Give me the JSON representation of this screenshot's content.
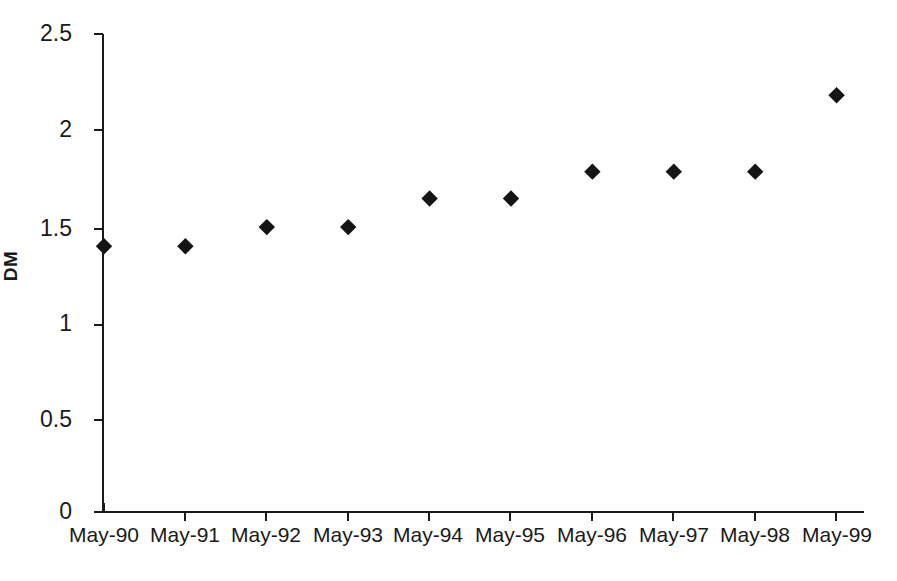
{
  "chart_data": {
    "type": "scatter",
    "title": "",
    "subtitle": "",
    "xlabel": "",
    "ylabel": "DM",
    "categories": [
      "May-90",
      "May-91",
      "May-92",
      "May-93",
      "May-94",
      "May-95",
      "May-96",
      "May-97",
      "May-98",
      "May-99"
    ],
    "values": [
      1.39,
      1.39,
      1.49,
      1.49,
      1.64,
      1.64,
      1.78,
      1.78,
      1.78,
      2.18
    ],
    "series": [
      {
        "name": "DM",
        "values": [
          1.39,
          1.39,
          1.49,
          1.49,
          1.64,
          1.64,
          1.78,
          1.78,
          1.78,
          2.18
        ]
      }
    ],
    "ylim": [
      0,
      2.5
    ],
    "y_ticks": [
      0,
      0.5,
      1,
      1.5,
      2,
      2.5
    ],
    "y_tick_labels": [
      "0",
      "0.5",
      "1",
      "1.5",
      "2",
      "2.5"
    ],
    "x_tick_labels": [
      "May-90",
      "May-91",
      "May-92",
      "May-93",
      "May-94",
      "May-95",
      "May-96",
      "May-97",
      "May-98",
      "May-99"
    ],
    "grid": false,
    "legend": false,
    "legend_position": "none",
    "marker": "diamond",
    "marker_color": "#141414",
    "axis_color": "#1a1a1a",
    "background_color": "#ffffff",
    "annotations": []
  },
  "axis": {
    "y_label": "DM"
  }
}
